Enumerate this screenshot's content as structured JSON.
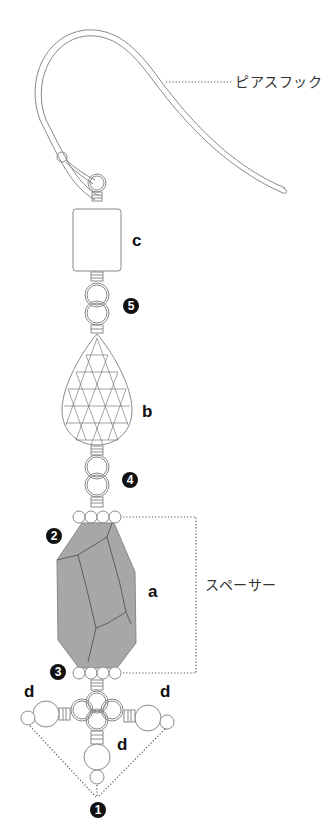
{
  "diagram": {
    "type": "jewelry-assembly",
    "colors": {
      "line": "#8a8a8a",
      "stone_fill": "#a7a7a7",
      "stone_lines": "#5a5a5a",
      "badge": "#111111",
      "dotted": "#555555"
    },
    "callouts": {
      "hook": "ピアスフック",
      "spacer": "スペーサー"
    },
    "part_labels": {
      "c": "c",
      "b": "b",
      "a": "a",
      "d_left": "d",
      "d_right": "d",
      "d_bottom": "d"
    },
    "step_numbers": {
      "n1": "1",
      "n2": "2",
      "n3": "3",
      "n4": "4",
      "n5": "5"
    }
  }
}
